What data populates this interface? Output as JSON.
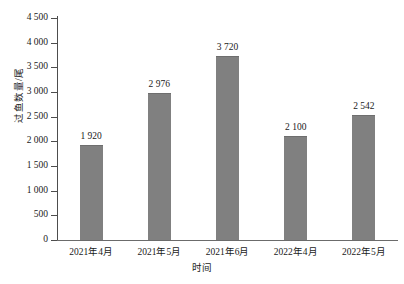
{
  "chart_data": {
    "type": "bar",
    "title": "",
    "xlabel": "时间",
    "ylabel": "过鱼数量/尾",
    "categories": [
      "2021年4月",
      "2021年5月",
      "2021年6月",
      "2022年4月",
      "2022年5月"
    ],
    "values": [
      1920,
      2976,
      3720,
      2100,
      2542
    ],
    "value_labels": [
      "1 920",
      "2 976",
      "3 720",
      "2 100",
      "2 542"
    ],
    "ylim": [
      0,
      4500
    ],
    "ytick_values": [
      0,
      500,
      1000,
      1500,
      2000,
      2500,
      3000,
      3500,
      4000,
      4500
    ],
    "ytick_labels": [
      "0",
      "500",
      "1 000",
      "1 500",
      "2 000",
      "2 500",
      "3 000",
      "3 500",
      "4 000",
      "4 500"
    ],
    "grid": false,
    "legend": false,
    "legend_position": "none",
    "series": [
      {
        "name": "过鱼数量",
        "values": [
          1920,
          2976,
          3720,
          2100,
          2542
        ],
        "color": "#808080"
      }
    ],
    "colors": {
      "bar_fill": "#808080",
      "bar_edge": "#6e6e6e",
      "axis": "#4d4d4d",
      "text": "#1a1a1a",
      "background": "#ffffff"
    }
  }
}
